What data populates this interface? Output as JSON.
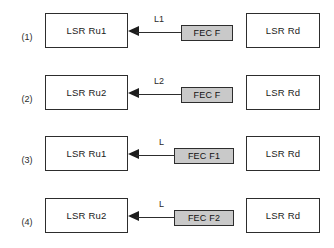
{
  "diagram": {
    "background_color": "#ffffff",
    "box_border_color": "#2d2d2d",
    "fec_fill_color": "#c9c9c9",
    "rows": [
      {
        "index_label": "(1)",
        "left_node": "LSR Ru1",
        "link_label": "L1",
        "fec_label": "FEC F",
        "right_node": "LSR Rd",
        "arrow_direction": "left"
      },
      {
        "index_label": "(2)",
        "left_node": "LSR Ru2",
        "link_label": "L2",
        "fec_label": "FEC F",
        "right_node": "LSR Rd",
        "arrow_direction": "left"
      },
      {
        "index_label": "(3)",
        "left_node": "LSR Ru1",
        "link_label": "L",
        "fec_label": "FEC F1",
        "right_node": "LSR Rd",
        "arrow_direction": "left"
      },
      {
        "index_label": "(4)",
        "left_node": "LSR Ru2",
        "link_label": "L",
        "fec_label": "FEC F2",
        "right_node": "LSR Rd",
        "arrow_direction": "left"
      }
    ]
  }
}
